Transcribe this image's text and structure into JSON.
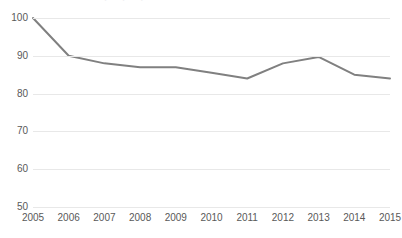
{
  "chart_data": {
    "type": "line",
    "title": "",
    "subtitle": "",
    "xlabel": "",
    "ylabel": "",
    "categories": [
      "2005",
      "2006",
      "2007",
      "2008",
      "2009",
      "2010",
      "2011",
      "2012",
      "2013",
      "2014",
      "2015"
    ],
    "values": [
      100,
      90,
      88,
      87,
      87,
      85.5,
      84,
      88,
      89.7,
      85,
      84
    ],
    "series": [
      {
        "name": "",
        "values": [
          100,
          90,
          88,
          87,
          87,
          85.5,
          84,
          88,
          89.7,
          85,
          84
        ]
      }
    ],
    "ylim": [
      50,
      100
    ],
    "y_ticks": [
      50,
      60,
      70,
      80,
      90,
      100
    ],
    "y_tick_labels": [
      "50",
      "60",
      "70",
      "80",
      "90",
      "100"
    ],
    "x_tick_labels": [
      "2005",
      "2006",
      "2007",
      "2008",
      "2009",
      "2010",
      "2011",
      "2012",
      "2013",
      "2014",
      "2015"
    ],
    "grid": "horizontal",
    "legend": "none",
    "markers": "none",
    "annotations": [],
    "colors": {
      "line": "#808080",
      "gridline": "#e8e8e8",
      "text": "#595959",
      "background": "#ffffff"
    },
    "line_width": 2
  },
  "artifacts": {
    "top_cropped_text": ". . ."
  }
}
